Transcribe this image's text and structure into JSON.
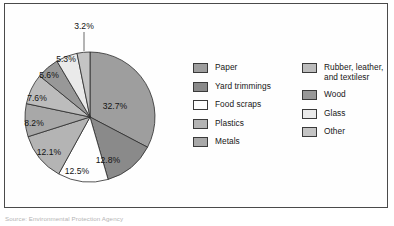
{
  "figure": {
    "source_note": "Source: Environmental Protection Agency"
  },
  "legend": {
    "left_column": [
      {
        "label": "Paper",
        "color": "#9e9e9e"
      },
      {
        "label": "Yard trimmings",
        "color": "#8a8a8a"
      },
      {
        "label": "Food scraps",
        "color": "#fefefe"
      },
      {
        "label": "Plastics",
        "color": "#b4b4b4"
      },
      {
        "label": "Metals",
        "color": "#a8a8a8"
      }
    ],
    "right_column": [
      {
        "label": "Rubber, leather,\nand textilesr",
        "color": "#bcbcbc"
      },
      {
        "label": "Wood",
        "color": "#989898"
      },
      {
        "label": "Glass",
        "color": "#eaeaea"
      },
      {
        "label": "Other",
        "color": "#c4c4c4"
      }
    ]
  },
  "chart_data": {
    "type": "pie",
    "title": "",
    "unit": "percent",
    "start_angle_deg": 0,
    "direction": "clockwise",
    "legend_position": "right",
    "categories": [
      "Paper",
      "Yard trimmings",
      "Food scraps",
      "Plastics",
      "Metals",
      "Rubber, leather, and textilesr",
      "Wood",
      "Glass",
      "Other"
    ],
    "values": [
      32.7,
      12.8,
      12.5,
      12.1,
      8.2,
      7.6,
      5.6,
      5.3,
      3.2
    ],
    "labels": [
      "32.7%",
      "12.8%",
      "12.5%",
      "12.1%",
      "8.2%",
      "7.6%",
      "5.6%",
      "5.3%",
      "3.2%"
    ],
    "colors": [
      "#9e9e9e",
      "#8a8a8a",
      "#fefefe",
      "#b4b4b4",
      "#a8a8a8",
      "#bcbcbc",
      "#989898",
      "#eaeaea",
      "#c4c4c4"
    ],
    "slice_label_placement": [
      {
        "label": "32.7%",
        "inside": true,
        "x": 110,
        "y": 103
      },
      {
        "label": "12.8%",
        "inside": true,
        "x": 103,
        "y": 157
      },
      {
        "label": "12.5%",
        "inside": true,
        "x": 72,
        "y": 168
      },
      {
        "label": "12.1%",
        "inside": true,
        "x": 44,
        "y": 149
      },
      {
        "label": "8.2%",
        "inside": true,
        "x": 29,
        "y": 120
      },
      {
        "label": "7.6%",
        "inside": true,
        "x": 32,
        "y": 95
      },
      {
        "label": "5.6%",
        "inside": true,
        "x": 44,
        "y": 72
      },
      {
        "label": "5.3%",
        "inside": true,
        "x": 61,
        "y": 56
      },
      {
        "label": "3.2%",
        "inside": false,
        "x": 79,
        "y": 23,
        "leader": {
          "x1": 79,
          "y1": 28,
          "x2": 79,
          "y2": 47
        }
      }
    ],
    "geometry": {
      "cx": 85,
      "cy": 113,
      "r": 65
    },
    "total": 100.0
  }
}
